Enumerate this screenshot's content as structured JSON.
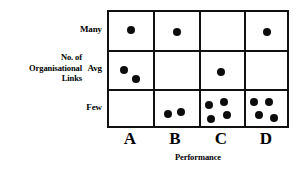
{
  "chart_data": {
    "type": "scatter",
    "title": "",
    "xlabel": "Performance",
    "ylabel": "No. of Organisational Links",
    "ylabel_lines": [
      "No. of",
      "Organisational",
      "Links"
    ],
    "categories": [
      "A",
      "B",
      "C",
      "D"
    ],
    "y_categories": [
      "Many",
      "Avg",
      "Few"
    ],
    "grid": true,
    "legend": "none",
    "dot_color": "#0c0c0c",
    "axis_color": "#111111",
    "counts": {
      "Many": {
        "A": 1,
        "B": 1,
        "C": 0,
        "D": 1
      },
      "Avg": {
        "A": 2,
        "B": 0,
        "C": 1,
        "D": 0
      },
      "Few": {
        "A": 0,
        "B": 2,
        "C": 4,
        "D": 4
      }
    },
    "points": [
      {
        "x": "A",
        "y": "Many",
        "px": 22,
        "py": 18
      },
      {
        "x": "B",
        "y": "Many",
        "px": 68,
        "py": 20
      },
      {
        "x": "D",
        "y": "Many",
        "px": 158,
        "py": 20
      },
      {
        "x": "A",
        "y": "Avg",
        "px": 15,
        "py": 58
      },
      {
        "x": "A",
        "y": "Avg",
        "px": 27,
        "py": 67
      },
      {
        "x": "C",
        "y": "Avg",
        "px": 112,
        "py": 60
      },
      {
        "x": "B",
        "y": "Few",
        "px": 59,
        "py": 102
      },
      {
        "x": "B",
        "y": "Few",
        "px": 72,
        "py": 100
      },
      {
        "x": "C",
        "y": "Few",
        "px": 100,
        "py": 93
      },
      {
        "x": "C",
        "y": "Few",
        "px": 115,
        "py": 90
      },
      {
        "x": "C",
        "y": "Few",
        "px": 102,
        "py": 107
      },
      {
        "x": "C",
        "y": "Few",
        "px": 118,
        "py": 103
      },
      {
        "x": "D",
        "y": "Few",
        "px": 145,
        "py": 90
      },
      {
        "x": "D",
        "y": "Few",
        "px": 160,
        "py": 90
      },
      {
        "x": "D",
        "y": "Few",
        "px": 150,
        "py": 103
      },
      {
        "x": "D",
        "y": "Few",
        "px": 165,
        "py": 106
      }
    ]
  }
}
